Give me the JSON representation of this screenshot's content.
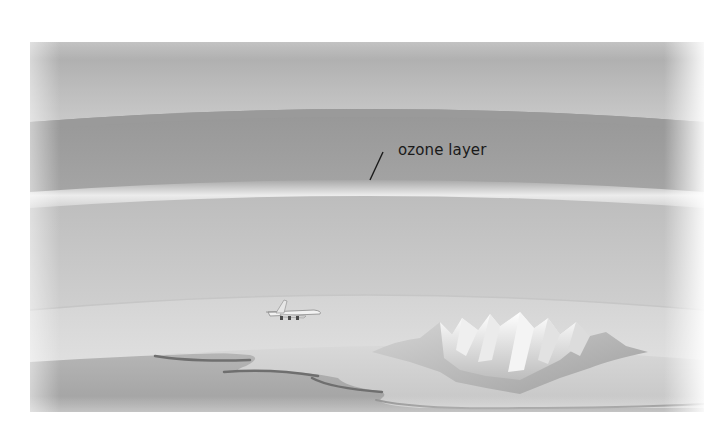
{
  "diagram": {
    "labels": [
      {
        "id": "ozone",
        "text": "ozone layer"
      }
    ],
    "elements": {
      "airplane": "airplane",
      "mountains": "snow-capped mountain range",
      "coastline": "land and sea coastline"
    },
    "colors": {
      "upper_atmosphere": "#b4b4b4",
      "stratosphere_band": "#9c9c9c",
      "ozone_band": "#e6e6e6",
      "lower_atmosphere": "#c2c2c2",
      "troposphere": "#d6d6d6",
      "sea": "#a8a8a8",
      "land": "#d0d0d0",
      "label_text": "#1a1a1a"
    }
  }
}
